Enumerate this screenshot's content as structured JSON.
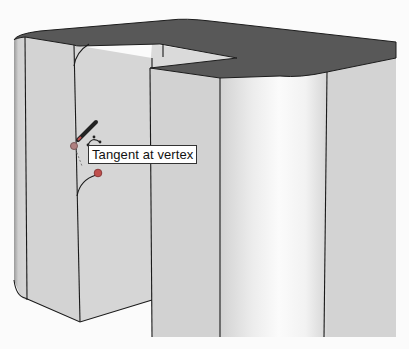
{
  "app": {
    "viewport_label": "3D model viewport"
  },
  "tool": {
    "active_tool": "pencil-icon",
    "inference_tooltip": "Tangent at vertex"
  },
  "colors": {
    "top_face": "#5a5a5a",
    "side_face": "#d0d0d0",
    "highlight": "#f4f4f4",
    "edge": "#1a1a1a",
    "inference_point": "#c0504d",
    "background": "#fbfbfb"
  },
  "model": {
    "description": "Extruded profile with rounded corners, arc being drawn tangent to vertex"
  }
}
